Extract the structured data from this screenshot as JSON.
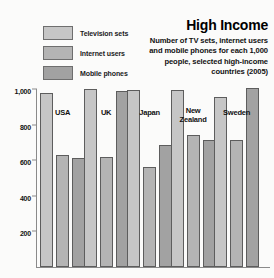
{
  "title": "High Income",
  "subtitle": "Number of TV sets, internet users and mobile phones for each 1,000 people, selected high-income countries (2005)",
  "legend": [
    {
      "label": "Television sets",
      "key": "tv",
      "color": "#c6c6c6",
      "swatch_name": "legend-swatch-television-sets"
    },
    {
      "label": "Internet users",
      "key": "net",
      "color": "#b4b4b4",
      "swatch_name": "legend-swatch-internet-users"
    },
    {
      "label": "Mobile phones",
      "key": "mob",
      "color": "#a2a2a2",
      "swatch_name": "legend-swatch-mobile-phones"
    }
  ],
  "axis": {
    "ticks": [
      "1,000",
      "800",
      "600",
      "400",
      "200"
    ],
    "tick_values": [
      1000,
      800,
      600,
      400,
      200
    ]
  },
  "chart_data": {
    "type": "bar",
    "title": "High Income",
    "subtitle": "Number of TV sets, internet users and mobile phones for each 1,000 people, selected high-income countries (2005)",
    "xlabel": "",
    "ylabel": "",
    "ylim": [
      0,
      1000
    ],
    "ytick_labels": [
      "200",
      "400",
      "600",
      "800",
      "1,000"
    ],
    "ytick_values": [
      200,
      400,
      600,
      800,
      1000
    ],
    "grid": false,
    "legend_position": "top-left",
    "categories": [
      "USA",
      "UK",
      "Japan",
      "New Zealand",
      "Sweden"
    ],
    "series": [
      {
        "name": "Television sets",
        "values": [
          975,
          1000,
          995,
          995,
          955
        ]
      },
      {
        "name": "Internet users",
        "values": [
          630,
          620,
          560,
          740,
          715
        ]
      },
      {
        "name": "Mobile phones",
        "values": [
          610,
          990,
          685,
          715,
          1005
        ]
      }
    ]
  }
}
